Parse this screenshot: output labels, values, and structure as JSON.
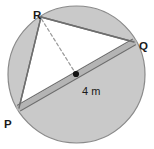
{
  "figure": {
    "colors": {
      "circle_fill": "#c9c9c9",
      "circle_stroke": "#8a8a8a",
      "triangle_fill": "#ffffff",
      "triangle_stroke": "#6e6e6e",
      "diameter_band": "#b4b4b4",
      "diameter_stroke": "#707070",
      "dashed_stroke": "#9a9a9a",
      "center_dot": "#141414",
      "label_color": "#1a1a1a",
      "background": "#ffffff"
    },
    "circle": {
      "center_x": 76.5,
      "center_y": 74.5,
      "radius": 68.5
    },
    "center_point": {
      "name": "center-dot",
      "x": 76,
      "y": 74,
      "radius": 3.1
    },
    "vertices": [
      {
        "id": "P",
        "label": "P",
        "x": 19,
        "y": 108,
        "label_x": 4,
        "label_y": 125
      },
      {
        "id": "Q",
        "label": "Q",
        "x": 134,
        "y": 42,
        "label_x": 139,
        "label_y": 47
      },
      {
        "id": "R",
        "label": "R",
        "x": 41,
        "y": 17,
        "label_x": 33,
        "label_y": 11
      }
    ],
    "measure": {
      "label": "4 m",
      "x": 82,
      "y": 92,
      "describes": "radius from center to Q along diameter PQ"
    },
    "segments": [
      {
        "name": "segment-PQ-diameter",
        "from": "P",
        "to": "Q",
        "style": "double-band",
        "is_diameter": true
      },
      {
        "name": "segment-PR",
        "from": "P",
        "to": "R",
        "style": "solid"
      },
      {
        "name": "segment-RQ",
        "from": "R",
        "to": "Q",
        "style": "solid"
      },
      {
        "name": "segment-R-to-center",
        "from": "R",
        "to": "center",
        "style": "dashed"
      }
    ]
  }
}
